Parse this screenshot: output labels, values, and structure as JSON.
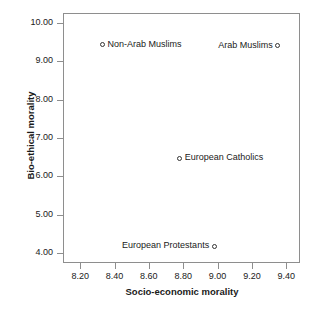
{
  "chart_data": {
    "type": "scatter",
    "title": "",
    "xlabel": "Socio-economic morality",
    "ylabel": "Bio-ethical morality",
    "xlim": [
      8.1,
      9.48
    ],
    "ylim": [
      3.75,
      10.25
    ],
    "xticks": [
      "8.20",
      "8.40",
      "8.60",
      "8.80",
      "9.00",
      "9.20",
      "9.40"
    ],
    "yticks": [
      "10.00",
      "9.00",
      "8.00",
      "7.00",
      "6.00",
      "5.00",
      "4.00"
    ],
    "grid": false,
    "legend": "none",
    "marker_style": "open-circle",
    "points": [
      {
        "label": "Non-Arab Muslims",
        "x": 8.33,
        "y": 9.42,
        "label_side": "right"
      },
      {
        "label": "Arab Muslims",
        "x": 9.35,
        "y": 9.4,
        "label_side": "left"
      },
      {
        "label": "European Catholics",
        "x": 8.78,
        "y": 6.48,
        "label_side": "right"
      },
      {
        "label": "European Protestants",
        "x": 8.98,
        "y": 4.18,
        "label_side": "left"
      }
    ]
  },
  "colors": {
    "background": "#ffffff",
    "axis": "#8e8e8e",
    "text": "#1a1a1a",
    "marker": "#333333"
  }
}
